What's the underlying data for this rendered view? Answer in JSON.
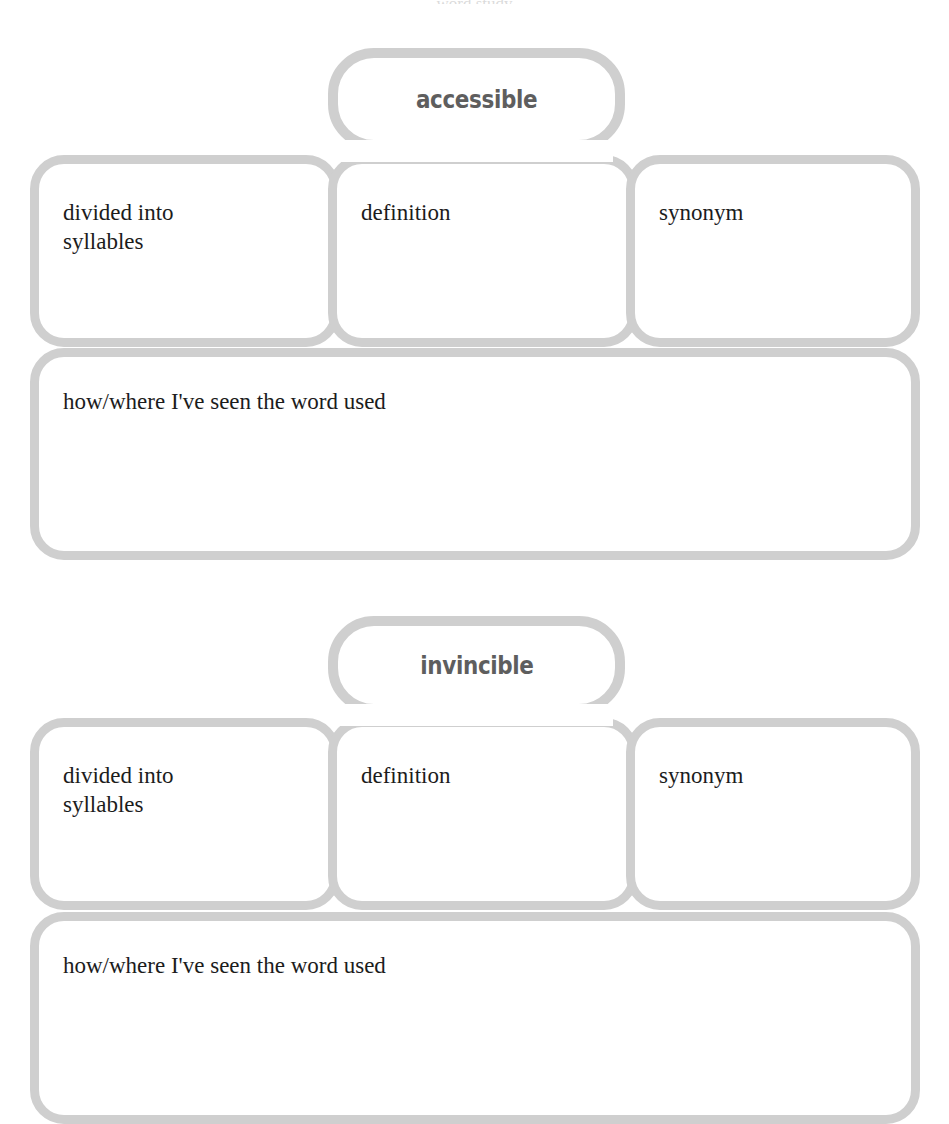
{
  "document": {
    "type": "word-study-graphic-organizer",
    "worksheet_count": 2,
    "outline_color": "#cfcfcf",
    "word_text_color": "#5e5e5e",
    "prompt_text_color": "#1c1c1c",
    "page_background": "#ffffff"
  },
  "organizers": [
    {
      "word": "accessible",
      "columns": [
        {
          "label": "divided into\nsyllables"
        },
        {
          "label": "definition"
        },
        {
          "label": "synonym"
        }
      ],
      "bottom_prompt": "how/where I've seen the word used"
    },
    {
      "word": "invincible",
      "columns": [
        {
          "label": "divided into\nsyllables"
        },
        {
          "label": "definition"
        },
        {
          "label": "synonym"
        }
      ],
      "bottom_prompt": "how/where I've seen the word used"
    }
  ],
  "top_crop_remnant": "word study"
}
